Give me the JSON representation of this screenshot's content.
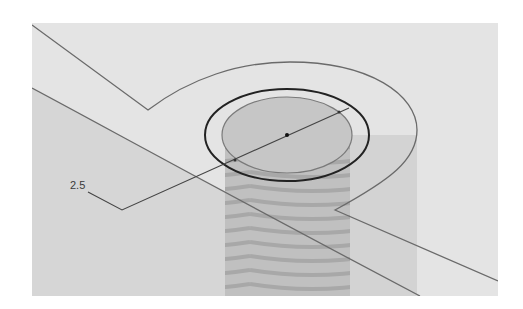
{
  "viewport": {
    "description": "3D CAD sketch view of a threaded hole on a bracket face",
    "background": "#ffffff",
    "frame_fill": "#e4e4e4",
    "shaded_face_fill": "#d6d6d6",
    "cylinder_fill": "#bdbdbd",
    "side_strip_fill": "#d2d2d2",
    "edge_color": "#6a6a6a",
    "selection_color": "#222222"
  },
  "dimension": {
    "label": "2.5",
    "type": "diameter"
  },
  "features": {
    "hole": {
      "shape": "threaded-cylinder"
    },
    "outer_circle": {
      "selected": true
    },
    "center_point": {
      "visible": true
    }
  }
}
